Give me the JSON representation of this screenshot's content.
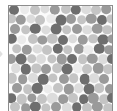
{
  "figure": {
    "background_color": "#fbfbfb",
    "border_color": "#8d8d8d",
    "page_background": "#ffffff",
    "edge_marker": {
      "name": "chevron-right",
      "color": "#d9d9d9"
    }
  },
  "chart_data": {
    "type": "scatter",
    "title": "",
    "subtitle": "",
    "xlabel": "",
    "ylabel": "",
    "xlim": [
      0,
      105
    ],
    "ylim": [
      0,
      106
    ],
    "grid": false,
    "legend": "none",
    "marker": "circle",
    "palette": {
      "dark": "#6e6e6e",
      "mid": "#9a9a9a",
      "light": "#c4c4c4",
      "pale": "#dcdcdc",
      "faint": "#ebebeb"
    },
    "radius_range": [
      4.0,
      5.6
    ],
    "point_count": 120,
    "points": [
      {
        "x": 5,
        "y": 4,
        "r": 5.0,
        "shade": "dark"
      },
      {
        "x": 16,
        "y": 3,
        "r": 4.8,
        "shade": "faint"
      },
      {
        "x": 26,
        "y": 4,
        "r": 5.0,
        "shade": "light"
      },
      {
        "x": 37,
        "y": 3,
        "r": 4.6,
        "shade": "pale"
      },
      {
        "x": 47,
        "y": 4,
        "r": 5.2,
        "shade": "mid"
      },
      {
        "x": 58,
        "y": 3,
        "r": 5.0,
        "shade": "light"
      },
      {
        "x": 68,
        "y": 4,
        "r": 5.2,
        "shade": "dark"
      },
      {
        "x": 79,
        "y": 3,
        "r": 4.8,
        "shade": "pale"
      },
      {
        "x": 89,
        "y": 4,
        "r": 5.0,
        "shade": "light"
      },
      {
        "x": 99,
        "y": 3,
        "r": 4.8,
        "shade": "mid"
      },
      {
        "x": 2,
        "y": 13,
        "r": 4.8,
        "shade": "light"
      },
      {
        "x": 12,
        "y": 14,
        "r": 5.2,
        "shade": "mid"
      },
      {
        "x": 22,
        "y": 13,
        "r": 4.6,
        "shade": "pale"
      },
      {
        "x": 32,
        "y": 14,
        "r": 5.0,
        "shade": "light"
      },
      {
        "x": 43,
        "y": 13,
        "r": 4.8,
        "shade": "faint"
      },
      {
        "x": 53,
        "y": 14,
        "r": 5.4,
        "shade": "dark"
      },
      {
        "x": 63,
        "y": 13,
        "r": 5.0,
        "shade": "mid"
      },
      {
        "x": 74,
        "y": 14,
        "r": 4.8,
        "shade": "light"
      },
      {
        "x": 84,
        "y": 13,
        "r": 5.2,
        "shade": "mid"
      },
      {
        "x": 95,
        "y": 14,
        "r": 5.0,
        "shade": "dark"
      },
      {
        "x": 104,
        "y": 13,
        "r": 4.6,
        "shade": "light"
      },
      {
        "x": 6,
        "y": 23,
        "r": 5.0,
        "shade": "mid"
      },
      {
        "x": 17,
        "y": 24,
        "r": 4.8,
        "shade": "light"
      },
      {
        "x": 27,
        "y": 23,
        "r": 5.2,
        "shade": "dark"
      },
      {
        "x": 38,
        "y": 24,
        "r": 4.6,
        "shade": "pale"
      },
      {
        "x": 48,
        "y": 23,
        "r": 5.4,
        "shade": "dark"
      },
      {
        "x": 59,
        "y": 24,
        "r": 4.8,
        "shade": "light"
      },
      {
        "x": 69,
        "y": 23,
        "r": 5.0,
        "shade": "mid"
      },
      {
        "x": 80,
        "y": 24,
        "r": 4.8,
        "shade": "pale"
      },
      {
        "x": 90,
        "y": 23,
        "r": 5.2,
        "shade": "mid"
      },
      {
        "x": 100,
        "y": 24,
        "r": 4.8,
        "shade": "light"
      },
      {
        "x": 3,
        "y": 33,
        "r": 5.2,
        "shade": "dark"
      },
      {
        "x": 13,
        "y": 34,
        "r": 4.8,
        "shade": "faint"
      },
      {
        "x": 24,
        "y": 33,
        "r": 5.0,
        "shade": "light"
      },
      {
        "x": 34,
        "y": 34,
        "r": 4.6,
        "shade": "mid"
      },
      {
        "x": 44,
        "y": 33,
        "r": 5.2,
        "shade": "light"
      },
      {
        "x": 55,
        "y": 34,
        "r": 5.0,
        "shade": "dark"
      },
      {
        "x": 65,
        "y": 33,
        "r": 4.8,
        "shade": "pale"
      },
      {
        "x": 75,
        "y": 34,
        "r": 5.2,
        "shade": "mid"
      },
      {
        "x": 86,
        "y": 33,
        "r": 4.8,
        "shade": "light"
      },
      {
        "x": 96,
        "y": 34,
        "r": 5.4,
        "shade": "dark"
      },
      {
        "x": 105,
        "y": 33,
        "r": 4.6,
        "shade": "mid"
      },
      {
        "x": 8,
        "y": 43,
        "r": 4.8,
        "shade": "light"
      },
      {
        "x": 18,
        "y": 44,
        "r": 5.2,
        "shade": "mid"
      },
      {
        "x": 29,
        "y": 43,
        "r": 4.6,
        "shade": "pale"
      },
      {
        "x": 39,
        "y": 44,
        "r": 5.0,
        "shade": "light"
      },
      {
        "x": 50,
        "y": 43,
        "r": 5.2,
        "shade": "dark"
      },
      {
        "x": 60,
        "y": 44,
        "r": 4.8,
        "shade": "light"
      },
      {
        "x": 71,
        "y": 43,
        "r": 5.0,
        "shade": "mid"
      },
      {
        "x": 81,
        "y": 44,
        "r": 4.8,
        "shade": "faint"
      },
      {
        "x": 92,
        "y": 43,
        "r": 5.2,
        "shade": "dark"
      },
      {
        "x": 102,
        "y": 44,
        "r": 4.8,
        "shade": "mid"
      },
      {
        "x": 2,
        "y": 53,
        "r": 5.0,
        "shade": "mid"
      },
      {
        "x": 12,
        "y": 54,
        "r": 5.4,
        "shade": "dark"
      },
      {
        "x": 23,
        "y": 53,
        "r": 4.8,
        "shade": "light"
      },
      {
        "x": 33,
        "y": 54,
        "r": 5.0,
        "shade": "pale"
      },
      {
        "x": 44,
        "y": 53,
        "r": 4.6,
        "shade": "light"
      },
      {
        "x": 54,
        "y": 54,
        "r": 5.2,
        "shade": "mid"
      },
      {
        "x": 64,
        "y": 53,
        "r": 5.0,
        "shade": "dark"
      },
      {
        "x": 75,
        "y": 54,
        "r": 4.8,
        "shade": "light"
      },
      {
        "x": 85,
        "y": 53,
        "r": 5.2,
        "shade": "mid"
      },
      {
        "x": 96,
        "y": 54,
        "r": 4.8,
        "shade": "pale"
      },
      {
        "x": 105,
        "y": 53,
        "r": 5.0,
        "shade": "dark"
      },
      {
        "x": 7,
        "y": 63,
        "r": 4.8,
        "shade": "pale"
      },
      {
        "x": 17,
        "y": 64,
        "r": 5.2,
        "shade": "dark"
      },
      {
        "x": 28,
        "y": 63,
        "r": 4.6,
        "shade": "light"
      },
      {
        "x": 38,
        "y": 64,
        "r": 5.0,
        "shade": "mid"
      },
      {
        "x": 49,
        "y": 63,
        "r": 4.8,
        "shade": "light"
      },
      {
        "x": 59,
        "y": 64,
        "r": 5.4,
        "shade": "dark"
      },
      {
        "x": 70,
        "y": 63,
        "r": 4.8,
        "shade": "faint"
      },
      {
        "x": 80,
        "y": 64,
        "r": 5.0,
        "shade": "light"
      },
      {
        "x": 91,
        "y": 63,
        "r": 5.2,
        "shade": "mid"
      },
      {
        "x": 101,
        "y": 64,
        "r": 4.8,
        "shade": "light"
      },
      {
        "x": 3,
        "y": 73,
        "r": 5.2,
        "shade": "light"
      },
      {
        "x": 14,
        "y": 74,
        "r": 4.8,
        "shade": "mid"
      },
      {
        "x": 24,
        "y": 73,
        "r": 5.0,
        "shade": "pale"
      },
      {
        "x": 35,
        "y": 74,
        "r": 5.2,
        "shade": "dark"
      },
      {
        "x": 45,
        "y": 73,
        "r": 4.6,
        "shade": "light"
      },
      {
        "x": 56,
        "y": 74,
        "r": 5.0,
        "shade": "mid"
      },
      {
        "x": 66,
        "y": 73,
        "r": 4.8,
        "shade": "light"
      },
      {
        "x": 77,
        "y": 74,
        "r": 5.2,
        "shade": "dark"
      },
      {
        "x": 87,
        "y": 73,
        "r": 4.8,
        "shade": "pale"
      },
      {
        "x": 97,
        "y": 74,
        "r": 5.0,
        "shade": "mid"
      },
      {
        "x": 8,
        "y": 83,
        "r": 5.0,
        "shade": "mid"
      },
      {
        "x": 19,
        "y": 84,
        "r": 4.8,
        "shade": "light"
      },
      {
        "x": 29,
        "y": 83,
        "r": 5.2,
        "shade": "dark"
      },
      {
        "x": 40,
        "y": 84,
        "r": 4.6,
        "shade": "faint"
      },
      {
        "x": 50,
        "y": 83,
        "r": 5.0,
        "shade": "light"
      },
      {
        "x": 61,
        "y": 84,
        "r": 5.2,
        "shade": "mid"
      },
      {
        "x": 71,
        "y": 83,
        "r": 4.8,
        "shade": "pale"
      },
      {
        "x": 82,
        "y": 84,
        "r": 5.4,
        "shade": "dark"
      },
      {
        "x": 92,
        "y": 83,
        "r": 4.8,
        "shade": "light"
      },
      {
        "x": 103,
        "y": 84,
        "r": 5.0,
        "shade": "mid"
      },
      {
        "x": 2,
        "y": 93,
        "r": 4.8,
        "shade": "dark"
      },
      {
        "x": 13,
        "y": 94,
        "r": 5.2,
        "shade": "light"
      },
      {
        "x": 23,
        "y": 93,
        "r": 4.6,
        "shade": "mid"
      },
      {
        "x": 34,
        "y": 94,
        "r": 5.0,
        "shade": "light"
      },
      {
        "x": 44,
        "y": 93,
        "r": 5.2,
        "shade": "pale"
      },
      {
        "x": 55,
        "y": 94,
        "r": 4.8,
        "shade": "mid"
      },
      {
        "x": 65,
        "y": 93,
        "r": 5.0,
        "shade": "light"
      },
      {
        "x": 76,
        "y": 94,
        "r": 4.8,
        "shade": "dark"
      },
      {
        "x": 86,
        "y": 93,
        "r": 5.2,
        "shade": "mid"
      },
      {
        "x": 97,
        "y": 94,
        "r": 4.8,
        "shade": "light"
      },
      {
        "x": 105,
        "y": 93,
        "r": 5.0,
        "shade": "dark"
      },
      {
        "x": 6,
        "y": 102,
        "r": 5.0,
        "shade": "light"
      },
      {
        "x": 17,
        "y": 103,
        "r": 4.8,
        "shade": "mid"
      },
      {
        "x": 27,
        "y": 102,
        "r": 5.2,
        "shade": "dark"
      },
      {
        "x": 38,
        "y": 103,
        "r": 4.6,
        "shade": "light"
      },
      {
        "x": 48,
        "y": 102,
        "r": 5.0,
        "shade": "mid"
      },
      {
        "x": 59,
        "y": 103,
        "r": 5.2,
        "shade": "pale"
      },
      {
        "x": 69,
        "y": 102,
        "r": 4.8,
        "shade": "dark"
      },
      {
        "x": 80,
        "y": 103,
        "r": 5.0,
        "shade": "light"
      },
      {
        "x": 90,
        "y": 102,
        "r": 5.2,
        "shade": "mid"
      },
      {
        "x": 101,
        "y": 103,
        "r": 4.8,
        "shade": "light"
      }
    ]
  }
}
